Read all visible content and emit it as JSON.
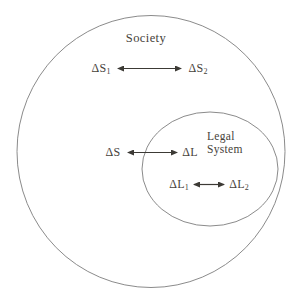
{
  "diagram": {
    "outer_zone": {
      "label": "Society"
    },
    "inner_zone": {
      "label_line1": "Legal",
      "label_line2": "System"
    },
    "nodes": {
      "s1": {
        "base": "ΔS",
        "sub": "1"
      },
      "s2": {
        "base": "ΔS",
        "sub": "2"
      },
      "s": {
        "base": "ΔS",
        "sub": ""
      },
      "l": {
        "base": "ΔL",
        "sub": ""
      },
      "l1": {
        "base": "ΔL",
        "sub": "1"
      },
      "l2": {
        "base": "ΔL",
        "sub": "2"
      }
    },
    "relations": [
      {
        "from": "ΔS1",
        "to": "ΔS2",
        "type": "bidirectional"
      },
      {
        "from": "ΔS",
        "to": "ΔL",
        "type": "bidirectional"
      },
      {
        "from": "ΔL1",
        "to": "ΔL2",
        "type": "bidirectional"
      }
    ]
  },
  "colors": {
    "background": "#ffffff",
    "circle_stroke": "#8b8b8b",
    "arrow": "#3c3a35",
    "text": "#46423a"
  }
}
